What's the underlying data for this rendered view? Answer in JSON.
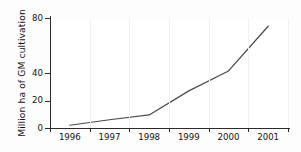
{
  "chart_data": {
    "type": "line",
    "title": "",
    "xlabel": "",
    "ylabel": "Million ha of GM cultivation",
    "categories": [
      "1996",
      "1997",
      "1998",
      "1999",
      "2000",
      "2001"
    ],
    "values": [
      2,
      6,
      9.5,
      27,
      41.5,
      74
    ],
    "series": [
      {
        "name": "GM cultivation",
        "values": [
          2,
          6,
          9.5,
          27,
          41.5,
          74
        ],
        "color": "#4a4a4a"
      }
    ],
    "ylim": [
      0,
      80
    ],
    "yticks": [
      0,
      20,
      40,
      80
    ],
    "ytick_labels": [
      "0",
      "20",
      "40",
      "80"
    ],
    "grid": false,
    "legend": "none",
    "line_color": "#4a4a4a",
    "axis_color": "#2b2b2b",
    "background_color": "#ffffff"
  }
}
